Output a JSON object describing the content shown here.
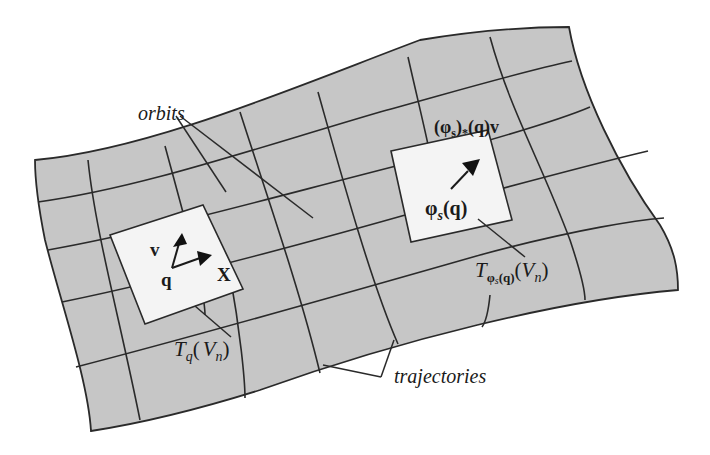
{
  "figure": {
    "colors": {
      "surface": "#c6c6c6",
      "tangent_plane": "#f4f4f4",
      "lines": "#2a2a2a",
      "background": "#ffffff"
    },
    "labels": {
      "orbits": "orbits",
      "trajectories": "trajectories",
      "v": "v",
      "X": "X",
      "q": "q",
      "Tq": "T",
      "Tq_sub": "q",
      "Tq_arg_open": "(",
      "Tq_V": "V",
      "Tq_V_sub": "n",
      "Tq_arg_close": ")",
      "phi_s_q": "φ",
      "phi_s_q_sub": "s",
      "phi_s_q_arg": "(q)",
      "pushforward_open": "(φ",
      "pushforward_sub": "s",
      "pushforward_close": ")",
      "pushforward_star": "*",
      "pushforward_arg": "(q)v",
      "Tphi": "T",
      "Tphi_sub": "φ",
      "Tphi_sub_s": "s",
      "Tphi_sub_q": "(q)",
      "Tphi_arg_open": "(",
      "Tphi_V": "V",
      "Tphi_V_sub": "n",
      "Tphi_arg_close": ")"
    }
  }
}
